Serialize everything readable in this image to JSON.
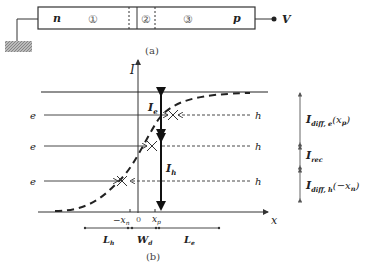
{
  "figure": {
    "panel_a": {
      "caption": "(a)",
      "left_label": "n",
      "right_label": "p",
      "regions": [
        "①",
        "②",
        "③"
      ],
      "terminal_label": "V"
    },
    "panel_b": {
      "caption": "(b)",
      "y_axis_label": "I",
      "x_axis_label": "x",
      "carrier_left": [
        "e",
        "e",
        "e"
      ],
      "carrier_right": [
        "h",
        "h",
        "h"
      ],
      "current_labels": {
        "electron": "I",
        "electron_sub": "e",
        "hole": "I",
        "hole_sub": "h"
      },
      "tick_labels": {
        "neg_xn": "−x",
        "neg_xn_sub": "n",
        "zero": "0",
        "xp": "x",
        "xp_sub": "p"
      },
      "lengths": {
        "Lh": "L",
        "Lh_sub": "h",
        "Wd": "W",
        "Wd_sub": "d",
        "Le": "L",
        "Le_sub": "e"
      },
      "right_annotations": {
        "diff_e": "I",
        "diff_e_sub": "diff, e",
        "diff_e_arg": "(x",
        "diff_e_arg_sub": "p",
        "diff_e_close": ")",
        "rec": "I",
        "rec_sub": "rec",
        "diff_h": "I",
        "diff_h_sub": "diff, h",
        "diff_h_arg": "(−x",
        "diff_h_arg_sub": "n",
        "diff_h_close": ")"
      }
    }
  }
}
